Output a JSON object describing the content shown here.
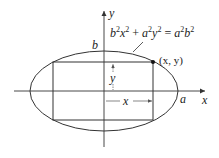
{
  "diagram": {
    "colors": {
      "stroke": "#333333",
      "text": "#222222",
      "background": "#ffffff"
    },
    "axes": {
      "x_label": "x",
      "y_label": "y",
      "origin": [
        104,
        91
      ],
      "x_axis_range_px": [
        14,
        205
      ],
      "y_axis_range_px": [
        11,
        147
      ]
    },
    "ellipse": {
      "equation": {
        "b": "b",
        "x": "x",
        "a": "a",
        "y": "y",
        "exp": "2",
        "plus": " + ",
        "equals": " = "
      },
      "center_px": [
        104,
        91
      ],
      "rx_px": 74,
      "ry_px": 40,
      "semi_major_label": "a",
      "semi_minor_label": "b"
    },
    "rectangle": {
      "corners_px": {
        "left": 53,
        "right": 153,
        "top": 62,
        "bottom": 120
      }
    },
    "point": {
      "label": "(x, y)",
      "position_px": [
        153,
        62
      ]
    },
    "dimensions": {
      "width_label": "x",
      "height_label": "y"
    }
  }
}
